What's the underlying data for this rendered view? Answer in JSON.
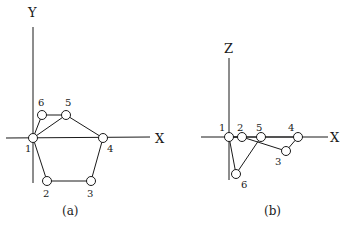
{
  "panel_a": {
    "caption": "(a)",
    "axis_x_label": "X",
    "axis_y_label": "Y",
    "nodes": [
      {
        "id": "1",
        "label": "1"
      },
      {
        "id": "2",
        "label": "2"
      },
      {
        "id": "3",
        "label": "3"
      },
      {
        "id": "4",
        "label": "4"
      },
      {
        "id": "5",
        "label": "5"
      },
      {
        "id": "6",
        "label": "6"
      }
    ],
    "edges": [
      [
        "1",
        "2"
      ],
      [
        "2",
        "3"
      ],
      [
        "3",
        "4"
      ],
      [
        "4",
        "5"
      ],
      [
        "5",
        "6"
      ],
      [
        "6",
        "1"
      ],
      [
        "1",
        "5"
      ]
    ]
  },
  "panel_b": {
    "caption": "(b)",
    "axis_x_label": "X",
    "axis_z_label": "Z",
    "nodes": [
      {
        "id": "1",
        "label": "1"
      },
      {
        "id": "2",
        "label": "2"
      },
      {
        "id": "3",
        "label": "3"
      },
      {
        "id": "4",
        "label": "4"
      },
      {
        "id": "5",
        "label": "5"
      },
      {
        "id": "6",
        "label": "6"
      }
    ],
    "edges": [
      [
        "1",
        "2"
      ],
      [
        "2",
        "3"
      ],
      [
        "3",
        "4"
      ],
      [
        "4",
        "5"
      ],
      [
        "5",
        "6"
      ],
      [
        "6",
        "1"
      ],
      [
        "1",
        "5"
      ]
    ]
  }
}
